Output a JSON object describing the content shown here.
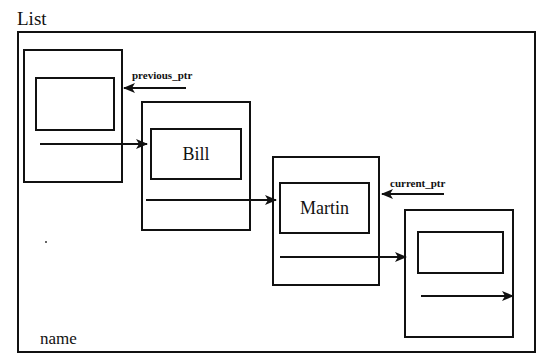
{
  "diagram": {
    "title": "List",
    "footer_label": "name",
    "pointers": {
      "previous": "previous_ptr",
      "current": "current_ptr"
    },
    "nodes": [
      {
        "name": ""
      },
      {
        "name": "Bill"
      },
      {
        "name": "Martin"
      },
      {
        "name": ""
      }
    ],
    "colors": {
      "line": "#111111",
      "background": "#ffffff"
    }
  }
}
